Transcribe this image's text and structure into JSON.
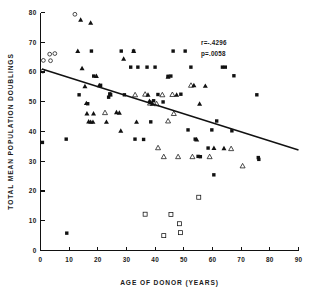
{
  "chart_data": {
    "type": "scatter",
    "title": "",
    "xlabel": "AGE OF DONOR (YEARS)",
    "ylabel": "TOTAL MEAN POPULATION DOUBLINGS",
    "xlim": [
      0,
      90
    ],
    "ylim": [
      0,
      80
    ],
    "xticks": [
      0,
      10,
      20,
      30,
      40,
      50,
      60,
      70,
      80,
      90
    ],
    "yticks": [
      0,
      10,
      20,
      30,
      40,
      50,
      60,
      70,
      80
    ],
    "grid": false,
    "legend_position": "none",
    "annotations": [
      {
        "name": "correlation",
        "text": "r=-.4296",
        "x": 56,
        "y": 69
      },
      {
        "name": "p-value",
        "text": "p=.0058",
        "x": 56,
        "y": 65.5
      }
    ],
    "regression_line": {
      "x_start": 0.5,
      "y_start": 61.0,
      "x_end": 90,
      "y_end": 33.8,
      "slope": -0.3,
      "intercept": 61.0
    },
    "series": [
      {
        "name": "filled-square",
        "marker": "filled-square",
        "points": [
          [
            0.7,
            36.3
          ],
          [
            9.0,
            37.4
          ],
          [
            9.2,
            5.8
          ],
          [
            13.5,
            52.3
          ],
          [
            16.5,
            49.3
          ],
          [
            17.8,
            67.0
          ],
          [
            18.6,
            58.6
          ],
          [
            21.0,
            55.5
          ],
          [
            23.8,
            51.5
          ],
          [
            24.2,
            52.6
          ],
          [
            24.5,
            52.4
          ],
          [
            28.2,
            67.0
          ],
          [
            29.3,
            52.3
          ],
          [
            31.5,
            61.6
          ],
          [
            32.5,
            67.0
          ],
          [
            33.0,
            37.4
          ],
          [
            34.0,
            61.6
          ],
          [
            36.0,
            37.3
          ],
          [
            37.2,
            61.6
          ],
          [
            38.5,
            43.2
          ],
          [
            39.5,
            50.3
          ],
          [
            40.0,
            61.6
          ],
          [
            41.0,
            52.4
          ],
          [
            42.8,
            49.9
          ],
          [
            44.5,
            58.5
          ],
          [
            45.5,
            58.6
          ],
          [
            46.3,
            67.0
          ],
          [
            49.0,
            52.5
          ],
          [
            50.5,
            67.0
          ],
          [
            51.5,
            40.5
          ],
          [
            52.5,
            61.6
          ],
          [
            54.0,
            37.4
          ],
          [
            55.0,
            31.6
          ],
          [
            55.8,
            31.5
          ],
          [
            58.5,
            34.4
          ],
          [
            59.8,
            40.5
          ],
          [
            60.5,
            25.4
          ],
          [
            61.5,
            43.5
          ],
          [
            63.5,
            61.6
          ],
          [
            64.5,
            61.6
          ],
          [
            66.8,
            40.2
          ],
          [
            67.5,
            58.7
          ],
          [
            75.5,
            52.3
          ],
          [
            76.0,
            31.2
          ],
          [
            76.2,
            30.6
          ]
        ]
      },
      {
        "name": "filled-triangle",
        "marker": "filled-triangle",
        "points": [
          [
            14.0,
            77.5
          ],
          [
            17.5,
            76.5
          ],
          [
            13.0,
            67.0
          ],
          [
            14.5,
            61.2
          ],
          [
            15.5,
            55.2
          ],
          [
            16.0,
            49.5
          ],
          [
            16.2,
            46.0
          ],
          [
            16.8,
            43.3
          ],
          [
            17.5,
            43.2
          ],
          [
            18.3,
            43.2
          ],
          [
            18.5,
            46.0
          ],
          [
            19.5,
            58.6
          ],
          [
            20.5,
            55.5
          ],
          [
            23.0,
            43.2
          ],
          [
            24.3,
            52.4
          ],
          [
            26.5,
            46.4
          ],
          [
            27.5,
            46.3
          ],
          [
            28.0,
            40.2
          ],
          [
            29.0,
            64.4
          ],
          [
            32.5,
            67.0
          ],
          [
            33.5,
            43.2
          ],
          [
            37.5,
            52.3
          ],
          [
            38.0,
            50.2
          ],
          [
            38.5,
            49.8
          ],
          [
            39.0,
            49.3
          ],
          [
            44.5,
            58.4
          ],
          [
            47.5,
            52.3
          ],
          [
            53.5,
            55.5
          ],
          [
            54.5,
            37.3
          ],
          [
            55.5,
            49.3
          ],
          [
            57.5,
            55.3
          ],
          [
            60.5,
            34.4
          ],
          [
            64.0,
            34.3
          ]
        ]
      },
      {
        "name": "open-triangle",
        "marker": "open-triangle",
        "points": [
          [
            22.5,
            46.3
          ],
          [
            33.0,
            52.3
          ],
          [
            36.5,
            52.5
          ],
          [
            38.2,
            49.5
          ],
          [
            40.5,
            49.3
          ],
          [
            42.5,
            52.3
          ],
          [
            43.0,
            31.5
          ],
          [
            44.5,
            43.5
          ],
          [
            41.0,
            34.5
          ],
          [
            46.5,
            46.0
          ],
          [
            48.0,
            31.5
          ],
          [
            52.5,
            55.5
          ],
          [
            53.0,
            31.5
          ],
          [
            59.0,
            31.5
          ],
          [
            66.5,
            34.2
          ],
          [
            70.5,
            28.4
          ],
          [
            46.0,
            52.4
          ]
        ]
      },
      {
        "name": "open-circle",
        "marker": "open-circle",
        "points": [
          [
            12.0,
            79.4
          ],
          [
            3.2,
            66.0
          ],
          [
            5.0,
            66.2
          ],
          [
            1.0,
            63.9
          ],
          [
            3.5,
            63.8
          ],
          [
            0.8,
            60.3
          ]
        ]
      },
      {
        "name": "open-square",
        "marker": "open-square",
        "points": [
          [
            36.5,
            12.2
          ],
          [
            43.0,
            5.0
          ],
          [
            45.5,
            12.1
          ],
          [
            48.5,
            9.0
          ],
          [
            48.8,
            6.0
          ],
          [
            55.2,
            17.9
          ]
        ]
      }
    ]
  }
}
